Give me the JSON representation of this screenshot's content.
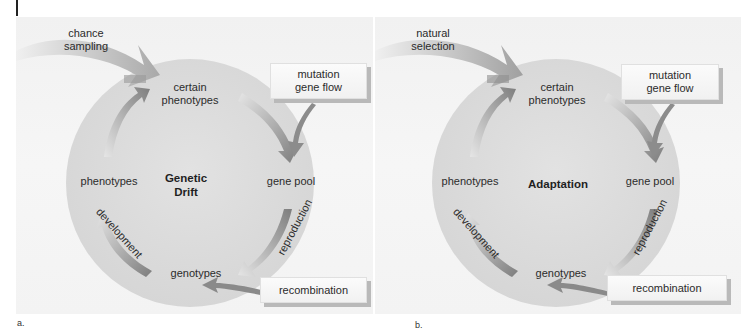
{
  "figure": {
    "colors": {
      "background": "#f3f3f3",
      "circle_fill": "#dcdcdc",
      "arrow_dark": "#7f7f7f",
      "arrow_light": "#d8d8d8",
      "box_fill": "#f8f8f8",
      "box_shadow": "#b9b9b9",
      "text": "#2b2b2b"
    },
    "panels": [
      {
        "letter": "a.",
        "center_title_line1": "Genetic",
        "center_title_line2": "Drift",
        "input_arrow_line1": "chance",
        "input_arrow_line2": "sampling",
        "nodes": {
          "top_line1": "certain",
          "top_line2": "phenotypes",
          "right": "gene pool",
          "bottom": "genotypes",
          "left": "phenotypes"
        },
        "arc_labels": {
          "right_bottom": "reproduction",
          "left_bottom": "development"
        },
        "boxes": {
          "top_line1": "mutation",
          "top_line2": "gene flow",
          "bottom": "recombination"
        }
      },
      {
        "letter": "b.",
        "center_title_line1": "Adaptation",
        "input_arrow_line1": "natural",
        "input_arrow_line2": "selection",
        "nodes": {
          "top_line1": "certain",
          "top_line2": "phenotypes",
          "right": "gene pool",
          "bottom": "genotypes",
          "left": "phenotypes"
        },
        "arc_labels": {
          "right_bottom": "reproduction",
          "left_bottom": "development"
        },
        "boxes": {
          "top_line1": "mutation",
          "top_line2": "gene flow",
          "bottom": "recombination"
        }
      }
    ]
  }
}
